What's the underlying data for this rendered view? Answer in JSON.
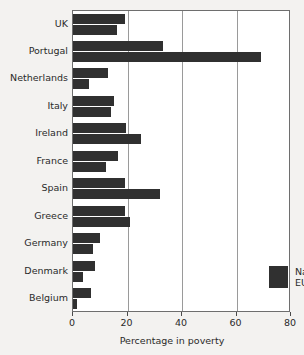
{
  "chart_data": {
    "type": "bar",
    "orientation": "horizontal",
    "title": "",
    "xlabel": "Percentage in poverty",
    "ylabel": "",
    "xlim": [
      0,
      80
    ],
    "xticks": [
      0,
      20,
      40,
      60,
      80
    ],
    "xtick_labels": [
      "0",
      "20",
      "40",
      "60",
      "80"
    ],
    "grid": true,
    "grid_axis": "x",
    "legend_position": "inside-lower-right",
    "categories": [
      "UK",
      "Portugal",
      "Netherlands",
      "Italy",
      "Ireland",
      "France",
      "Spain",
      "Greece",
      "Germany",
      "Denmark",
      "Belgium"
    ],
    "series": [
      {
        "name": "National",
        "color": "#303030",
        "values": [
          19,
          33,
          13,
          15,
          19.5,
          16.5,
          19,
          19,
          10,
          8,
          6.5
        ]
      },
      {
        "name": "EU",
        "color": "#303030",
        "values": [
          16,
          69,
          6,
          14,
          25,
          12,
          32,
          21,
          7.5,
          3.5,
          1.5
        ]
      }
    ]
  },
  "colors": {
    "background": "#f3f2f0",
    "plot_background": "#ffffff",
    "bar": "#303030",
    "gridline": "#9a9a9a",
    "axis": "#6e6e6e",
    "text": "#2a2a2a"
  }
}
